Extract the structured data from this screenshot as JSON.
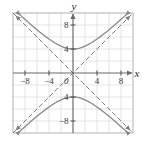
{
  "figure": {
    "title": "",
    "background_color": "#ffffff",
    "frame_color": "#9a9a9a",
    "grid_color": "#d4d4d4",
    "axis_color": "#6b6b6b",
    "curve_color": "#8a8a8a",
    "asymptote_color": "#7d7d7d",
    "label_color": "#3a3a3a"
  },
  "axes": {
    "x_axis_label": "x",
    "y_axis_label": "y",
    "origin_label": "0",
    "x_ticks": [
      {
        "value": -8,
        "label": "−8"
      },
      {
        "value": -4,
        "label": "−4"
      },
      {
        "value": 4,
        "label": "4"
      },
      {
        "value": 8,
        "label": "8"
      }
    ],
    "y_ticks": [
      {
        "value": 8,
        "label": "8"
      },
      {
        "value": 4,
        "label": "4"
      },
      {
        "value": -4,
        "label": "4"
      },
      {
        "value": -8,
        "label": "−8"
      }
    ],
    "xlim": [
      -10,
      10
    ],
    "ylim": [
      -10,
      10
    ],
    "grid_step": 2,
    "grid": true,
    "arrows": [
      "x-positive",
      "y-positive"
    ]
  },
  "chart_data": {
    "type": "line",
    "title": "",
    "xlabel": "x",
    "ylabel": "y",
    "xlim": [
      -10,
      10
    ],
    "ylim": [
      -10,
      10
    ],
    "grid": true,
    "legend": "none",
    "equation": "y²/16 − x²/16 = 1",
    "vertices": [
      [
        0,
        4
      ],
      [
        0,
        -4
      ]
    ],
    "series": [
      {
        "name": "upper branch",
        "style": "solid",
        "arrows": "both-ends",
        "points": [
          [
            -9.5,
            10.35
          ],
          [
            -9.0,
            9.85
          ],
          [
            -8.5,
            9.38
          ],
          [
            -8.0,
            8.94
          ],
          [
            -7.5,
            8.5
          ],
          [
            -7.0,
            8.06
          ],
          [
            -6.5,
            7.63
          ],
          [
            -6.0,
            7.21
          ],
          [
            -5.5,
            6.8
          ],
          [
            -5.0,
            6.4
          ],
          [
            -4.5,
            6.02
          ],
          [
            -4.0,
            5.66
          ],
          [
            -3.5,
            5.32
          ],
          [
            -3.0,
            5.0
          ],
          [
            -2.5,
            4.72
          ],
          [
            -2.0,
            4.47
          ],
          [
            -1.5,
            4.27
          ],
          [
            -1.0,
            4.12
          ],
          [
            -0.5,
            4.03
          ],
          [
            0.0,
            4.0
          ],
          [
            0.5,
            4.03
          ],
          [
            1.0,
            4.12
          ],
          [
            1.5,
            4.27
          ],
          [
            2.0,
            4.47
          ],
          [
            2.5,
            4.72
          ],
          [
            3.0,
            5.0
          ],
          [
            3.5,
            5.32
          ],
          [
            4.0,
            5.66
          ],
          [
            4.5,
            6.02
          ],
          [
            5.0,
            6.4
          ],
          [
            5.5,
            6.8
          ],
          [
            6.0,
            7.21
          ],
          [
            6.5,
            7.63
          ],
          [
            7.0,
            8.06
          ],
          [
            7.5,
            8.5
          ],
          [
            8.0,
            8.94
          ],
          [
            8.5,
            9.38
          ],
          [
            9.0,
            9.85
          ],
          [
            9.5,
            10.35
          ]
        ]
      },
      {
        "name": "lower branch",
        "style": "solid",
        "arrows": "both-ends",
        "points": [
          [
            -9.5,
            -10.35
          ],
          [
            -9.0,
            -9.85
          ],
          [
            -8.5,
            -9.38
          ],
          [
            -8.0,
            -8.94
          ],
          [
            -7.5,
            -8.5
          ],
          [
            -7.0,
            -8.06
          ],
          [
            -6.5,
            -7.63
          ],
          [
            -6.0,
            -7.21
          ],
          [
            -5.5,
            -6.8
          ],
          [
            -5.0,
            -6.4
          ],
          [
            -4.5,
            -6.02
          ],
          [
            -4.0,
            -5.66
          ],
          [
            -3.5,
            -5.32
          ],
          [
            -3.0,
            -5.0
          ],
          [
            -2.5,
            -4.72
          ],
          [
            -2.0,
            -4.47
          ],
          [
            -1.5,
            -4.27
          ],
          [
            -1.0,
            -4.12
          ],
          [
            -0.5,
            -4.03
          ],
          [
            0.0,
            -4.0
          ],
          [
            0.5,
            -4.03
          ],
          [
            1.0,
            -4.12
          ],
          [
            1.5,
            -4.27
          ],
          [
            2.0,
            -4.47
          ],
          [
            2.5,
            -4.72
          ],
          [
            3.0,
            -5.0
          ],
          [
            3.5,
            -5.32
          ],
          [
            4.0,
            -5.66
          ],
          [
            4.5,
            -6.02
          ],
          [
            5.0,
            -6.4
          ],
          [
            5.5,
            -6.8
          ],
          [
            6.0,
            -7.21
          ],
          [
            6.5,
            -7.63
          ],
          [
            7.0,
            -8.06
          ],
          [
            7.5,
            -8.5
          ],
          [
            8.0,
            -8.94
          ],
          [
            8.5,
            -9.38
          ],
          [
            9.0,
            -9.85
          ],
          [
            9.5,
            -10.35
          ]
        ]
      },
      {
        "name": "asymptote y = x",
        "style": "dashed",
        "arrows": "both-ends",
        "points": [
          [
            -10,
            -10
          ],
          [
            10,
            10
          ]
        ]
      },
      {
        "name": "asymptote y = -x",
        "style": "dashed",
        "arrows": "both-ends",
        "points": [
          [
            -10,
            10
          ],
          [
            10,
            -10
          ]
        ]
      }
    ]
  }
}
